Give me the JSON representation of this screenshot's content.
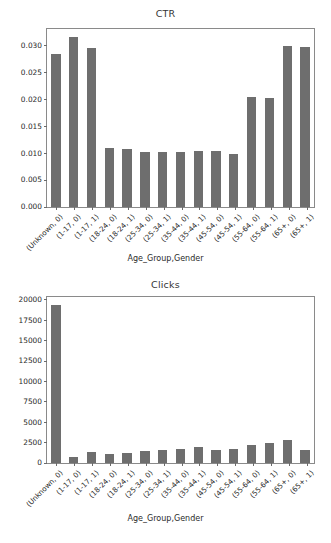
{
  "figure": {
    "background_color": "#ffffff",
    "bar_color": "#6e6e6e",
    "axis_color": "#8a8a8a"
  },
  "chart_data": [
    {
      "type": "bar",
      "title": "CTR",
      "xlabel": "Age_Group,Gender",
      "ylabel": "",
      "grid": false,
      "legend": "none",
      "ylim": [
        0,
        0.0335
      ],
      "yticks": [
        0.0,
        0.005,
        0.01,
        0.015,
        0.02,
        0.025,
        0.03
      ],
      "ytick_labels": [
        "0.000",
        "0.005",
        "0.010",
        "0.015",
        "0.020",
        "0.025",
        "0.030"
      ],
      "categories": [
        "(Unknown, 0)",
        "(1-17, 0)",
        "(1-17, 1)",
        "(18-24, 0)",
        "(18-24, 1)",
        "(25-34, 0)",
        "(25-34, 1)",
        "(35-44, 0)",
        "(35-44, 1)",
        "(45-54, 0)",
        "(45-54, 1)",
        "(55-64, 0)",
        "(55-64, 1)",
        "(65+, 0)",
        "(65+, 1)"
      ],
      "values": [
        0.0284,
        0.0317,
        0.0296,
        0.0109,
        0.0108,
        0.0103,
        0.0102,
        0.0103,
        0.0104,
        0.0104,
        0.0099,
        0.0204,
        0.0202,
        0.03,
        0.0298
      ]
    },
    {
      "type": "bar",
      "title": "Clicks",
      "xlabel": "Age_Group,Gender",
      "ylabel": "",
      "grid": false,
      "legend": "none",
      "ylim": [
        0,
        20600
      ],
      "yticks": [
        0,
        2500,
        5000,
        7500,
        10000,
        12500,
        15000,
        17500,
        20000
      ],
      "ytick_labels": [
        "0",
        "2500",
        "5000",
        "7500",
        "10000",
        "12500",
        "15000",
        "17500",
        "20000"
      ],
      "categories": [
        "(Unknown, 0)",
        "(1-17, 0)",
        "(1-17, 1)",
        "(18-24, 0)",
        "(18-24, 1)",
        "(25-34, 0)",
        "(25-34, 1)",
        "(35-44, 0)",
        "(35-44, 1)",
        "(45-54, 0)",
        "(45-54, 1)",
        "(55-64, 0)",
        "(55-64, 1)",
        "(65+, 0)",
        "(65+, 1)"
      ],
      "values": [
        19400,
        780,
        1400,
        1050,
        1200,
        1420,
        1600,
        1720,
        1950,
        1600,
        1720,
        2150,
        2450,
        2800,
        1600
      ]
    }
  ]
}
